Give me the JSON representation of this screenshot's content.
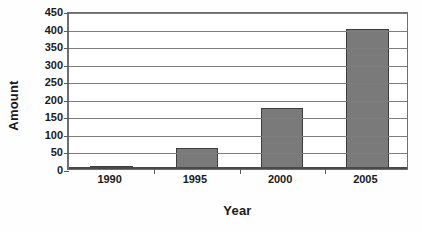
{
  "chart_data": {
    "type": "bar",
    "title": "",
    "subtitle": "",
    "categories": [
      "1990",
      "1995",
      "2000",
      "2005"
    ],
    "values": [
      10,
      60,
      175,
      400
    ],
    "series": [
      {
        "name": "Amount",
        "values": [
          10,
          60,
          175,
          400
        ]
      }
    ],
    "xlabel": "Year",
    "ylabel": "Amount",
    "ylim": [
      0,
      450
    ],
    "ytick_labels": [
      "0",
      "50",
      "100",
      "150",
      "200",
      "250",
      "300",
      "350",
      "400",
      "450"
    ],
    "ytick_values": [
      0,
      50,
      100,
      150,
      200,
      250,
      300,
      350,
      400,
      450
    ],
    "grid": true,
    "grid_axis": "y",
    "legend": false,
    "legend_position": "none",
    "bar_color": "#7a7a7a",
    "bar_border_color": "#3d3d3d",
    "gridline_color": "#7d7d7d",
    "axis_color": "#4a4a4a",
    "background_color": "#ffffff",
    "text_color": "#1a1a1a"
  }
}
